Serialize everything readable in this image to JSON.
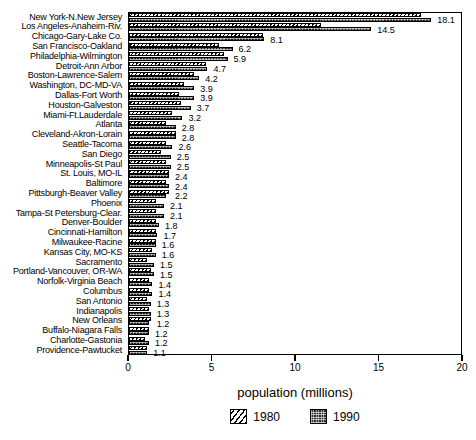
{
  "chart_data": {
    "type": "bar",
    "orientation": "horizontal",
    "title": "",
    "xlabel": "population (millions)",
    "ylabel": "",
    "xlim": [
      0,
      20
    ],
    "xticks": [
      0,
      5,
      10,
      15,
      20
    ],
    "xticklabels": [
      "0",
      "5",
      "10",
      "15",
      "20"
    ],
    "grid": false,
    "legend_position": "bottom-center",
    "value_labels_series": "1990",
    "categories": [
      "New York-N.New Jersey",
      "Los Angeles-Anaheim-Riv.",
      "Chicago-Gary-Lake Co.",
      "San Francisco-Oakland",
      "Philadelphia-Wilmington",
      "Detroit-Ann Arbor",
      "Boston-Lawrence-Salem",
      "Washington, DC-MD-VA",
      "Dallas-Fort Worth",
      "Houston-Galveston",
      "Miami-Ft.Lauderdale",
      "Atlanta",
      "Cleveland-Akron-Lorain",
      "Seattle-Tacoma",
      "San Diego",
      "Minneapolis-St Paul",
      "St. Louis, MO-IL",
      "Baltimore",
      "Pittsburgh-Beaver Valley",
      "Phoenix",
      "Tampa-St Petersburg-Clear.",
      "Denver-Boulder",
      "Cincinnati-Hamilton",
      "Milwaukee-Racine",
      "Kansas City, MO-KS",
      "Sacramento",
      "Portland-Vancouver, OR-WA",
      "Norfolk-Virginia Beach",
      "Columbus",
      "San Antonio",
      "Indianapolis",
      "New Orleans",
      "Buffalo-Niagara Falls",
      "Charlotte-Gastonia",
      "Providence-Pawtucket"
    ],
    "series": [
      {
        "name": "1980",
        "values": [
          17.5,
          11.5,
          8.0,
          5.4,
          5.7,
          4.6,
          3.9,
          3.3,
          3.0,
          3.1,
          2.6,
          2.2,
          2.8,
          2.2,
          1.9,
          2.2,
          2.4,
          2.2,
          2.4,
          1.6,
          1.6,
          1.6,
          1.6,
          1.6,
          1.4,
          1.1,
          1.3,
          1.2,
          1.2,
          1.1,
          1.2,
          1.3,
          1.2,
          0.97,
          1.08
        ]
      },
      {
        "name": "1990",
        "values": [
          18.1,
          14.5,
          8.1,
          6.2,
          5.9,
          4.7,
          4.2,
          3.9,
          3.9,
          3.7,
          3.2,
          2.8,
          2.8,
          2.6,
          2.5,
          2.5,
          2.4,
          2.4,
          2.2,
          2.1,
          2.1,
          1.8,
          1.7,
          1.6,
          1.6,
          1.5,
          1.5,
          1.4,
          1.4,
          1.3,
          1.3,
          1.2,
          1.2,
          1.2,
          1.1
        ]
      }
    ],
    "value_labels": [
      "18.1",
      "14.5",
      "8.1",
      "6.2",
      "5.9",
      "4.7",
      "4.2",
      "3.9",
      "3.9",
      "3.7",
      "3.2",
      "2.8",
      "2.8",
      "2.6",
      "2.5",
      "2.5",
      "2.4",
      "2.4",
      "2.2",
      "2.1",
      "2.1",
      "1.8",
      "1.7",
      "1.6",
      "1.6",
      "1.5",
      "1.5",
      "1.4",
      "1.4",
      "1.3",
      "1.3",
      "1.2",
      "1.2",
      "1.2",
      "1.1"
    ],
    "legend": [
      {
        "label": "1980",
        "swatch": "diagonal-hatch"
      },
      {
        "label": "1990",
        "swatch": "dark-stipple"
      }
    ],
    "colors": {
      "series_1980_fill": "#ffffff",
      "series_1980_hatch": "#000000",
      "series_1990_fill": "#1b1b1b",
      "axis": "#000000",
      "text": "#000000",
      "background": "#ffffff"
    }
  }
}
